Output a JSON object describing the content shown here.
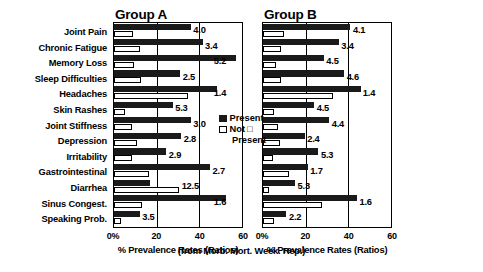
{
  "chart_data": {
    "type": "bar",
    "orientation": "horizontal",
    "title": "",
    "xlabel": "% Prevalence Rates (Ratios)",
    "ylabel": "",
    "source_note": "(from Morb. Mort. Week. Rep.)",
    "xlim": [
      0,
      60
    ],
    "xticks": [
      0,
      20,
      40,
      60
    ],
    "xticklabels": [
      "0%",
      "20",
      "40",
      "60"
    ],
    "grid": true,
    "legend": [
      "Present",
      "Not Present"
    ],
    "legend_position": "inside-center-right-of-panel-A",
    "categories": [
      "Joint Pain",
      "Chronic Fatigue",
      "Memory Loss",
      "Sleep Difficulties",
      "Headaches",
      "Skin Rashes",
      "Joint Stiffness",
      "Depression",
      "Irritability",
      "Gastrointestinal",
      "Diarrhea",
      "Sinus Congest.",
      "Speaking Prob."
    ],
    "panels": [
      {
        "name": "Group A",
        "series": [
          {
            "name": "Present",
            "values": [
              36.0,
              41.5,
              57.0,
              31.0,
              48.5,
              27.5,
              36.0,
              31.5,
              24.5,
              45.0,
              17.0,
              52.5,
              12.0
            ]
          },
          {
            "name": "Not Present",
            "values": [
              9.0,
              12.0,
              9.5,
              12.5,
              34.5,
              5.2,
              8.5,
              11.0,
              8.5,
              16.5,
              30.5,
              13.0,
              3.5
            ]
          }
        ],
        "ratios": [
          "4.0",
          "3.4",
          "5.2",
          "2.5",
          "1.4",
          "5.3",
          "3.0",
          "2.8",
          "2.9",
          "2.7",
          "12.5",
          "1.6",
          "3.5"
        ]
      },
      {
        "name": "Group B",
        "series": [
          {
            "name": "Present",
            "values": [
              41.0,
              35.5,
              28.5,
              38.0,
              46.0,
              24.0,
              31.0,
              19.5,
              26.0,
              21.0,
              15.0,
              44.0,
              11.0
            ]
          },
          {
            "name": "Not Present",
            "values": [
              10.0,
              8.5,
              6.3,
              8.3,
              33.0,
              5.3,
              7.0,
              8.1,
              4.9,
              12.4,
              2.8,
              27.5,
              5.0
            ]
          }
        ],
        "ratios": [
          "4.1",
          "3.4",
          "4.5",
          "4.6",
          "1.4",
          "4.5",
          "4.4",
          "2.4",
          "5.3",
          "1.7",
          "5.3",
          "1.6",
          "2.2"
        ]
      }
    ]
  },
  "legend": {
    "present_label": "Present",
    "not_label": "Not",
    "not_glyph": "□",
    "not_second_line": "Present"
  },
  "axis": {
    "title": "% Prevalence Rates (Ratios)",
    "source_note": "(from Morb. Mort. Week. Rep.)"
  }
}
